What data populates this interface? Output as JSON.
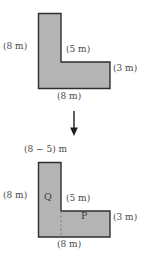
{
  "diagram": {
    "colors": {
      "fill": "#b4b4b4",
      "stroke": "#2e2e2e",
      "dashed": "#8c8c8c",
      "text": "#4a4a4a",
      "background": "#ffffff"
    },
    "top_figure": {
      "name": "l-shape-original",
      "labels": {
        "left": "(8 m)",
        "inner_top": "(5 m)",
        "right": "(3 m)",
        "bottom": "(8 m)"
      }
    },
    "arrow": {
      "name": "down-arrow-icon",
      "glyph": "↓",
      "direction": "down"
    },
    "bottom_figure": {
      "name": "l-shape-decomposed",
      "labels": {
        "top": "(8 − 5) m",
        "left": "(8 m)",
        "inner_top": "(5 m)",
        "right": "(3 m)",
        "bottom": "(8 m)"
      },
      "regions": [
        {
          "id": "Q",
          "label": "Q"
        },
        {
          "id": "P",
          "label": "P"
        }
      ]
    }
  }
}
